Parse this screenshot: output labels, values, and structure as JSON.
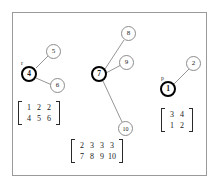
{
  "figure": {
    "background_color": "#ffffff",
    "border_color": "#9a9a9a",
    "root_node_color": "#000000",
    "plain_node_color": "#8c8c8c",
    "edge_color": "#7a7a7a"
  },
  "trees": [
    {
      "name": "left-tree",
      "root": {
        "label": "4",
        "pointer_label": "r"
      },
      "children": [
        {
          "label": "5"
        },
        {
          "label": "6"
        }
      ],
      "matrix": {
        "rows": [
          [
            "1",
            "2",
            "2"
          ],
          [
            "4",
            "5",
            "6"
          ]
        ]
      }
    },
    {
      "name": "middle-tree",
      "root": {
        "label": "7",
        "pointer_label": ""
      },
      "children": [
        {
          "label": "8"
        },
        {
          "label": "9"
        },
        {
          "label": "10"
        }
      ],
      "matrix": {
        "rows": [
          [
            "2",
            "3",
            "3",
            "3"
          ],
          [
            "7",
            "8",
            "9",
            "10"
          ]
        ]
      }
    },
    {
      "name": "right-tree",
      "root": {
        "label": "1",
        "pointer_label": "p"
      },
      "children": [
        {
          "label": "2"
        }
      ],
      "matrix": {
        "rows": [
          [
            "3",
            "4"
          ],
          [
            "1",
            "2"
          ]
        ]
      }
    }
  ]
}
